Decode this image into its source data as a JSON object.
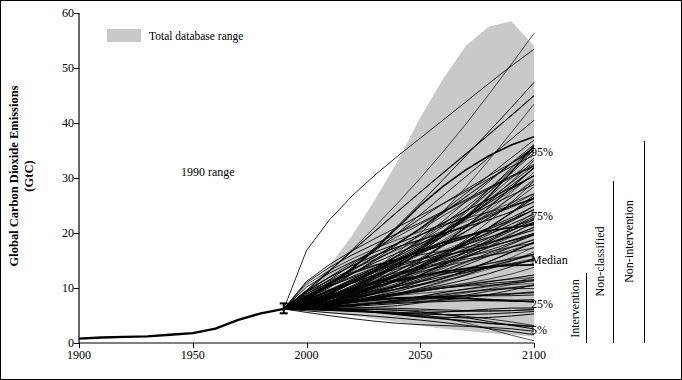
{
  "chart_data": {
    "type": "line",
    "title": "",
    "xlabel": "",
    "ylabel": "Global Carbon Dioxide Emissions (GtC)",
    "ylabel_line1": "Global Carbon Dioxide Emissions",
    "ylabel_line2": "(GtC)",
    "xlim": [
      1900,
      2100
    ],
    "ylim": [
      0,
      60
    ],
    "xticks": [
      1900,
      1950,
      2000,
      2050,
      2100
    ],
    "yticks": [
      0,
      10,
      20,
      30,
      40,
      50,
      60
    ],
    "grid": false,
    "legend": {
      "position": "top-left",
      "entries": [
        "Total database range"
      ]
    },
    "annotations": [
      "1990 range",
      "95%",
      "75%",
      "Median",
      "25%",
      "5%",
      "Intervention",
      "Non-classified",
      "Non-intervention"
    ],
    "series": [
      {
        "name": "Historical emissions",
        "x": [
          1900,
          1910,
          1920,
          1930,
          1940,
          1950,
          1960,
          1970,
          1980,
          1990
        ],
        "values": [
          0.8,
          1.0,
          1.1,
          1.2,
          1.5,
          1.8,
          2.6,
          4.2,
          5.4,
          6.2
        ]
      },
      {
        "name": "95th percentile",
        "x": [
          1990,
          2000,
          2010,
          2020,
          2030,
          2040,
          2050,
          2060,
          2070,
          2080,
          2090,
          2100
        ],
        "values": [
          6.2,
          8.0,
          10.5,
          13.5,
          17.0,
          21.0,
          25.0,
          28.5,
          31.5,
          34.0,
          36.0,
          37.5
        ]
      },
      {
        "name": "75th percentile",
        "x": [
          1990,
          2000,
          2010,
          2020,
          2030,
          2040,
          2050,
          2060,
          2070,
          2080,
          2090,
          2100
        ],
        "values": [
          6.2,
          7.4,
          9.0,
          11.0,
          13.0,
          15.0,
          16.8,
          18.3,
          19.5,
          20.4,
          21.0,
          21.5
        ]
      },
      {
        "name": "Median",
        "x": [
          1990,
          2000,
          2010,
          2020,
          2030,
          2040,
          2050,
          2060,
          2070,
          2080,
          2090,
          2100
        ],
        "values": [
          6.2,
          7.0,
          8.0,
          9.2,
          10.3,
          11.3,
          12.2,
          13.0,
          13.5,
          13.9,
          14.1,
          14.2
        ]
      },
      {
        "name": "25th percentile",
        "x": [
          1990,
          2000,
          2010,
          2020,
          2030,
          2040,
          2050,
          2060,
          2070,
          2080,
          2090,
          2100
        ],
        "values": [
          6.2,
          6.7,
          7.2,
          7.7,
          8.0,
          8.2,
          8.3,
          8.2,
          8.1,
          7.9,
          7.7,
          7.5
        ]
      },
      {
        "name": "5th percentile",
        "x": [
          1990,
          2000,
          2010,
          2020,
          2030,
          2040,
          2050,
          2060,
          2070,
          2080,
          2090,
          2100
        ],
        "values": [
          6.2,
          6.3,
          6.2,
          6.0,
          5.6,
          5.2,
          4.8,
          4.4,
          4.0,
          3.6,
          3.3,
          3.0
        ]
      },
      {
        "name": "Total database range upper",
        "x": [
          1990,
          2000,
          2010,
          2020,
          2030,
          2040,
          2050,
          2060,
          2070,
          2080,
          2090,
          2100
        ],
        "values": [
          6.5,
          9.5,
          14.0,
          19.5,
          26.0,
          33.0,
          41.0,
          48.0,
          54.0,
          57.5,
          58.5,
          54.0
        ]
      },
      {
        "name": "Total database range lower",
        "x": [
          1990,
          2000,
          2010,
          2020,
          2030,
          2040,
          2050,
          2060,
          2070,
          2080,
          2090,
          2100
        ],
        "values": [
          6.0,
          5.8,
          5.4,
          5.0,
          4.4,
          3.8,
          3.2,
          2.6,
          2.2,
          1.8,
          1.5,
          1.2
        ]
      }
    ]
  },
  "axis": {
    "y_ticks": [
      "0",
      "10",
      "20",
      "30",
      "40",
      "50",
      "60"
    ],
    "x_ticks": [
      "1900",
      "1950",
      "2000",
      "2050",
      "2100"
    ],
    "y_title_line1": "Global Carbon Dioxide Emissions",
    "y_title_line2": "(GtC)"
  },
  "legend": {
    "swatch_color": "#c9c9c9",
    "label": "Total database range"
  },
  "annotations": {
    "range_1990": "1990 range",
    "p95": "95%",
    "p75": "75%",
    "median": "Median",
    "p25": "25%",
    "p5": "5%"
  },
  "side_labels": {
    "intervention": "Intervention",
    "non_classified": "Non-classified",
    "non_intervention": "Non-intervention"
  },
  "colors": {
    "band": "#c9c9c9",
    "lines": "#000000",
    "background": "#ffffff"
  }
}
